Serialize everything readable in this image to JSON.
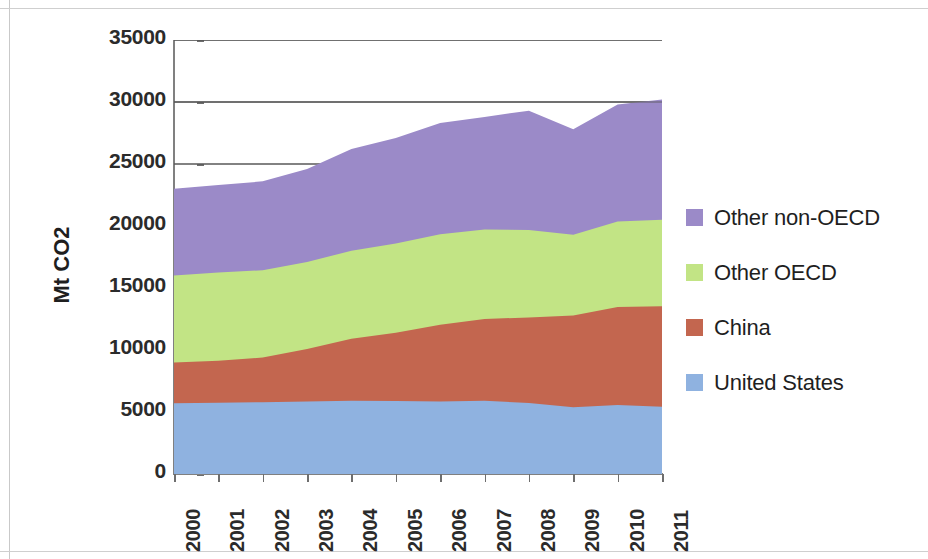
{
  "chart_data": {
    "type": "area",
    "stacked": true,
    "title": "",
    "xlabel": "",
    "ylabel": "Mt CO2",
    "x": [
      2000,
      2001,
      2002,
      2003,
      2004,
      2005,
      2006,
      2007,
      2008,
      2009,
      2010,
      2011
    ],
    "categories": [
      "2000",
      "2001",
      "2002",
      "2003",
      "2004",
      "2005",
      "2006",
      "2007",
      "2008",
      "2009",
      "2010",
      "2011"
    ],
    "ylim": [
      0,
      35000
    ],
    "yticks": [
      0,
      5000,
      10000,
      15000,
      20000,
      25000,
      30000,
      35000
    ],
    "ytick_labels": [
      "0",
      "5000",
      "10000",
      "15000",
      "20000",
      "25000",
      "30000",
      "35000"
    ],
    "grid": true,
    "gridlines_at": [
      25000,
      30000,
      35000
    ],
    "legend_position": "right",
    "series": [
      {
        "name": "United States",
        "color": "#8fb2e0",
        "values": [
          5700,
          5740,
          5790,
          5840,
          5910,
          5890,
          5840,
          5910,
          5720,
          5380,
          5560,
          5420
        ]
      },
      {
        "name": "China",
        "color": "#c3664f",
        "values": [
          3300,
          3400,
          3600,
          4250,
          5000,
          5500,
          6200,
          6600,
          6900,
          7400,
          7900,
          8100
        ]
      },
      {
        "name": "Other OECD",
        "color": "#c2e485",
        "values": [
          7000,
          7100,
          7050,
          7000,
          7100,
          7200,
          7300,
          7200,
          7060,
          6520,
          6900,
          6980
        ]
      },
      {
        "name": "Other non-OECD",
        "color": "#9b8ac8",
        "values": [
          7000,
          7060,
          7160,
          7510,
          8190,
          8510,
          8960,
          9090,
          9620,
          8500,
          9440,
          9700
        ]
      }
    ],
    "series_cumulative_top": {
      "United States": [
        5700,
        5740,
        5790,
        5840,
        5910,
        5890,
        5840,
        5910,
        5720,
        5380,
        5560,
        5420
      ],
      "China": [
        9000,
        9140,
        9390,
        10090,
        10910,
        11390,
        12040,
        12510,
        12620,
        12780,
        13460,
        13520
      ],
      "Other OECD": [
        16000,
        16240,
        16440,
        17090,
        18010,
        18590,
        19340,
        19710,
        19680,
        19300,
        20360,
        20500
      ],
      "Other non-OECD": [
        23000,
        23300,
        23600,
        24600,
        26200,
        27100,
        28300,
        28800,
        29300,
        27800,
        29800,
        30200
      ]
    }
  },
  "axes": {
    "y_title": "Mt CO2",
    "y_tick_labels": [
      "35000",
      "30000",
      "25000",
      "20000",
      "15000",
      "10000",
      "5000",
      "0"
    ],
    "x_tick_labels": [
      "2000",
      "2001",
      "2002",
      "2003",
      "2004",
      "2005",
      "2006",
      "2007",
      "2008",
      "2009",
      "2010",
      "2011"
    ]
  },
  "legend": {
    "items": [
      {
        "label": "Other non-OECD",
        "color": "#9b8ac8"
      },
      {
        "label": "Other OECD",
        "color": "#c2e485"
      },
      {
        "label": "China",
        "color": "#c3664f"
      },
      {
        "label": "United States",
        "color": "#8fb2e0"
      }
    ]
  },
  "colors": {
    "axis": "#808080",
    "grid": "#595959",
    "text": "#1f1f1f",
    "background": "#ffffff"
  }
}
